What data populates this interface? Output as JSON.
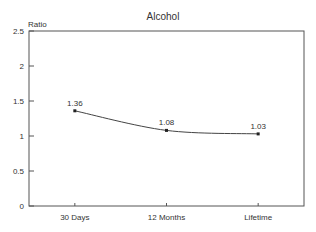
{
  "chart_data": {
    "type": "line",
    "title": "Alcohol",
    "xlabel": "",
    "ylabel": "Ratio",
    "categories": [
      "30 Days",
      "12 Months",
      "Lifetime"
    ],
    "series": [
      {
        "name": "Alcohol",
        "values": [
          1.36,
          1.08,
          1.03
        ]
      }
    ],
    "data_labels": [
      "1.36",
      "1.08",
      "1.03"
    ],
    "ylim": [
      0,
      2.5
    ],
    "yticks": [
      0,
      0.5,
      1,
      1.5,
      2,
      2.5
    ],
    "ytick_labels": [
      "0",
      "0.5",
      "1",
      "1.5",
      "2",
      "2.5"
    ],
    "grid": false,
    "legend": null
  },
  "colors": {
    "line": "#444444",
    "axis": "#555555",
    "text": "#333333",
    "background": "#ffffff"
  }
}
